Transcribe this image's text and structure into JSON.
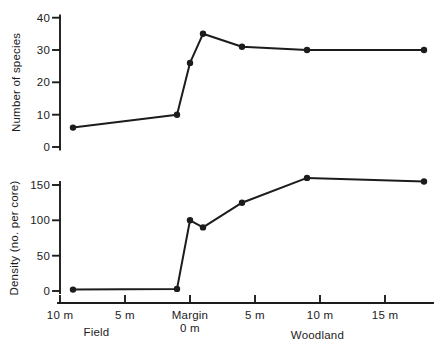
{
  "figure": {
    "background_color": "#ffffff",
    "ink_color": "#1c1c1c"
  },
  "chart_data": [
    {
      "type": "line",
      "panel": "top",
      "ylabel": "Number of species",
      "ylim": [
        0,
        40
      ],
      "yticks": [
        0,
        10,
        20,
        30,
        40
      ],
      "x_units": "meters from margin (negative = field side, positive = woodland side)",
      "x": [
        -9,
        -1,
        0,
        1,
        4,
        9,
        18
      ],
      "values": [
        6,
        10,
        26,
        35,
        31,
        30,
        30
      ],
      "marker": "filled-circle",
      "grid": false,
      "legend": "none"
    },
    {
      "type": "line",
      "panel": "bottom",
      "ylabel": "Density (no. per core)",
      "ylim": [
        0,
        150
      ],
      "yticks": [
        0,
        50,
        100,
        150
      ],
      "x_units": "meters from margin (negative = field side, positive = woodland side)",
      "x": [
        -9,
        -1,
        0,
        1,
        4,
        9,
        18
      ],
      "values": [
        2,
        3,
        100,
        90,
        125,
        160,
        155
      ],
      "marker": "filled-circle",
      "grid": false,
      "legend": "none"
    }
  ],
  "xaxis": {
    "shared": true,
    "ticks": [
      {
        "m": -10,
        "label": "10 m"
      },
      {
        "m": -5,
        "label": "5 m"
      },
      {
        "m": 0,
        "label": "Margin"
      },
      {
        "m": 5,
        "label": "5 m"
      },
      {
        "m": 10,
        "label": "10 m"
      },
      {
        "m": 15,
        "label": "15 m"
      }
    ],
    "sub_label": {
      "m": 0,
      "text": "0 m"
    },
    "zones": [
      {
        "label": "Field",
        "m": -7.2
      },
      {
        "label": "Woodland",
        "m": 9.8
      }
    ]
  }
}
